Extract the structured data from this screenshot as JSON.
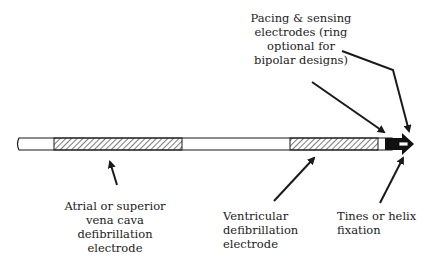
{
  "diagram": {
    "type": "lead schematic",
    "components": [
      {
        "id": "atrial-coil",
        "label_lines": [
          "Atrial or superior",
          "vena cava",
          "defibrillation",
          "electrode"
        ]
      },
      {
        "id": "ventricular-coil",
        "label_lines": [
          "Ventricular",
          "defibrillation",
          "electrode"
        ]
      },
      {
        "id": "pacing-electrodes",
        "label_lines": [
          "Pacing & sensing",
          "electrodes (ring",
          "optional for",
          "bipolar designs)"
        ]
      },
      {
        "id": "fixation",
        "label_lines": [
          "Tines or helix",
          "fixation"
        ]
      }
    ]
  },
  "colors": {
    "line": "#1a1a1a",
    "background": "#ffffff"
  }
}
